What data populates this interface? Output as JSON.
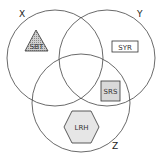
{
  "diagram": {
    "type": "venn",
    "sets": [
      {
        "id": "X",
        "label": "X"
      },
      {
        "id": "Y",
        "label": "Y"
      },
      {
        "id": "Z",
        "label": "Z"
      }
    ],
    "items": [
      {
        "label": "SBT",
        "shape": "triangle",
        "region": "X only",
        "fill": "#bdbdbd"
      },
      {
        "label": "SYR",
        "shape": "rectangle",
        "region": "Y only",
        "fill": "#ffffff"
      },
      {
        "label": "SRS",
        "shape": "square",
        "region": "Y and Z",
        "fill": "#d9d9d9"
      },
      {
        "label": "LRH",
        "shape": "hexagon",
        "region": "Z only",
        "fill": "#e6e6e6"
      }
    ]
  }
}
